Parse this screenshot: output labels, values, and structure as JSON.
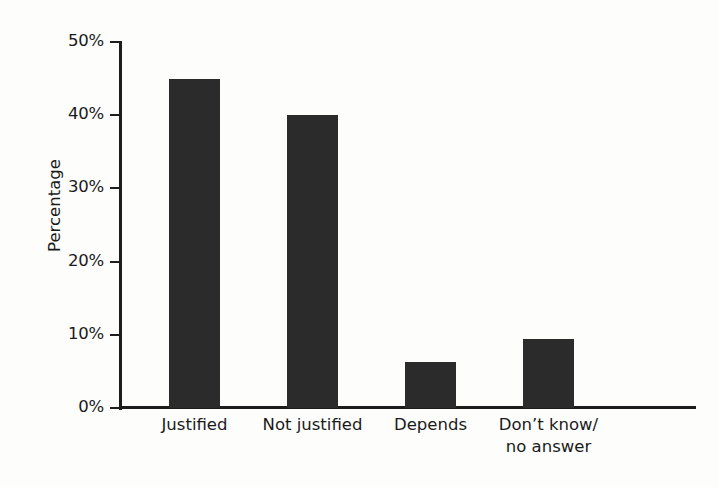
{
  "chart_data": {
    "type": "bar",
    "title": "",
    "xlabel": "",
    "ylabel": "Percentage",
    "categories": [
      "Justified",
      "Not justified",
      "Depends",
      "Don’t know/\nno answer"
    ],
    "values": [
      45.0,
      40.0,
      6.3,
      9.4
    ],
    "ylim": [
      0,
      50
    ],
    "ytick_values": [
      50,
      40,
      30,
      20,
      10,
      0
    ],
    "ytick_labels": [
      "50%",
      "40%",
      "30%",
      "20%",
      "10%",
      "0%"
    ],
    "grid": false,
    "legend": false,
    "bar_color": "#2b2b2b",
    "axis_color": "#1d1d1d",
    "background_color": "#fdfdfc"
  },
  "axis": {
    "y_title": "Percentage",
    "ticks": [
      {
        "label": "50%",
        "value": 50
      },
      {
        "label": "40%",
        "value": 40
      },
      {
        "label": "30%",
        "value": 30
      },
      {
        "label": "20%",
        "value": 20
      },
      {
        "label": "10%",
        "value": 10
      },
      {
        "label": "0%",
        "value": 0
      }
    ]
  },
  "bars": [
    {
      "label": "Justified",
      "value": 45.0
    },
    {
      "label": "Not justified",
      "value": 40.0
    },
    {
      "label": "Depends",
      "value": 6.3
    },
    {
      "label": "Don’t know/\nno answer",
      "value": 9.4
    }
  ]
}
